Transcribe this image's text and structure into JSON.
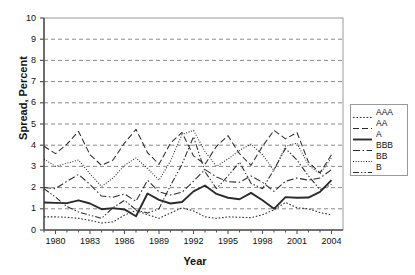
{
  "chart_data": {
    "type": "line",
    "title": "",
    "xlabel": "Year",
    "ylabel": "Spread, Percent",
    "xlim": [
      1979,
      2005
    ],
    "ylim": [
      0,
      10
    ],
    "ytick_values": [
      0,
      1,
      2,
      3,
      4,
      5,
      6,
      7,
      8,
      9,
      10
    ],
    "ytick_labels": [
      "0",
      "1",
      "2",
      "3",
      "4",
      "5",
      "6",
      "7",
      "8",
      "9",
      "10"
    ],
    "xtick_values": [
      1980,
      1983,
      1986,
      1989,
      1992,
      1995,
      1998,
      2001,
      2004
    ],
    "xtick_labels": [
      "1980",
      "1983",
      "1986",
      "1989",
      "1992",
      "1995",
      "1998",
      "2001",
      "2004"
    ],
    "grid": "horizontal-dashed",
    "legend_position": "right-middle",
    "x": [
      1979,
      1980,
      1981,
      1982,
      1983,
      1984,
      1985,
      1986,
      1987,
      1988,
      1989,
      1990,
      1991,
      1992,
      1993,
      1994,
      1995,
      1996,
      1997,
      1998,
      1999,
      2000,
      2001,
      2002,
      2003,
      2004
    ],
    "series": [
      {
        "name": "AAA",
        "style": "dotted",
        "values": [
          0.62,
          0.62,
          0.6,
          0.55,
          0.45,
          0.33,
          0.38,
          0.7,
          0.92,
          0.72,
          0.55,
          0.8,
          1.05,
          0.9,
          0.62,
          0.55,
          0.62,
          0.6,
          0.58,
          0.72,
          0.95,
          1.3,
          1.05,
          1.0,
          0.82,
          0.72
        ]
      },
      {
        "name": "AA",
        "style": "dashed",
        "values": [
          3.95,
          3.6,
          4.05,
          4.65,
          3.55,
          3.05,
          3.3,
          4.1,
          4.75,
          3.65,
          3.1,
          4.1,
          4.6,
          3.5,
          3.1,
          3.95,
          4.45,
          3.6,
          3.05,
          3.95,
          4.7,
          4.3,
          4.6,
          3.2,
          2.7,
          3.55
        ]
      },
      {
        "name": "A",
        "style": "solid",
        "values": [
          1.3,
          1.28,
          1.27,
          1.4,
          1.25,
          0.98,
          1.03,
          0.97,
          0.65,
          1.72,
          1.42,
          1.25,
          1.32,
          1.82,
          2.1,
          1.7,
          1.52,
          1.45,
          1.75,
          1.4,
          1.0,
          1.55,
          1.52,
          1.53,
          1.8,
          2.35
        ]
      },
      {
        "name": "BBB",
        "style": "dash-dot",
        "values": [
          2.0,
          1.95,
          2.3,
          2.62,
          2.15,
          1.6,
          1.55,
          1.7,
          1.35,
          2.35,
          1.8,
          1.65,
          1.78,
          2.3,
          2.85,
          2.5,
          2.28,
          2.25,
          2.55,
          2.25,
          1.82,
          2.3,
          2.45,
          2.35,
          2.45,
          2.85
        ]
      },
      {
        "name": "BB",
        "style": "fine-dotted",
        "values": [
          3.35,
          3.0,
          3.15,
          3.3,
          2.65,
          2.05,
          2.45,
          3.05,
          3.4,
          2.9,
          2.35,
          3.25,
          4.5,
          4.7,
          3.7,
          3.0,
          3.35,
          3.75,
          4.05,
          3.55,
          2.8,
          3.95,
          4.1,
          3.05,
          2.65,
          3.4
        ]
      },
      {
        "name": "B",
        "style": "dash-dot-dot",
        "values": [
          1.95,
          1.55,
          1.1,
          0.85,
          0.7,
          0.55,
          1.05,
          1.4,
          0.95,
          0.8,
          1.0,
          2.1,
          3.1,
          4.4,
          2.75,
          1.95,
          2.55,
          3.2,
          2.2,
          1.95,
          2.85,
          3.85,
          3.3,
          2.55,
          1.9,
          2.15
        ]
      }
    ]
  },
  "axis": {
    "ylabel": "Spread, Percent",
    "xlabel": "Year"
  },
  "legend": {
    "items": [
      {
        "label": "AAA"
      },
      {
        "label": "AA"
      },
      {
        "label": "A"
      },
      {
        "label": "BBB"
      },
      {
        "label": "BB"
      },
      {
        "label": "B"
      }
    ]
  }
}
